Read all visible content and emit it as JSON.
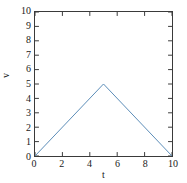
{
  "chart_data": {
    "type": "line",
    "title": "",
    "xlabel": "t",
    "ylabel": "v",
    "xlim": [
      0,
      10
    ],
    "ylim": [
      0,
      10
    ],
    "xticks": [
      0,
      2,
      4,
      6,
      8,
      10
    ],
    "yticks": [
      0,
      1,
      2,
      3,
      4,
      5,
      6,
      7,
      8,
      9,
      10
    ],
    "xtick_labels": [
      "0",
      "2",
      "4",
      "6",
      "8",
      "10"
    ],
    "ytick_labels": [
      "0",
      "1",
      "2",
      "3",
      "4",
      "5",
      "6",
      "7",
      "8",
      "9",
      "10"
    ],
    "grid": false,
    "legend": null,
    "series": [
      {
        "name": "v(t)",
        "color": "#5b8db8",
        "line_width": 1,
        "x": [
          0,
          5,
          10
        ],
        "values": [
          0,
          5,
          0
        ]
      }
    ]
  },
  "axes": {
    "frame_color": "#3a3a3a",
    "tick_direction": "in",
    "background": "#ffffff"
  }
}
